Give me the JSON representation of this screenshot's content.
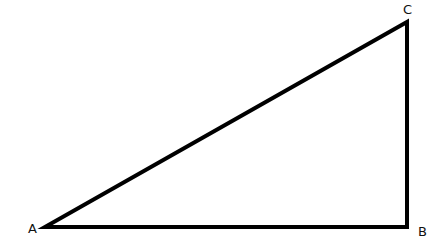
{
  "diagram": {
    "type": "right-triangle",
    "stroke_color": "#000000",
    "background": "#ffffff",
    "vertices": [
      {
        "label": "A",
        "x": 45,
        "y": 227,
        "label_x": 28,
        "label_y": 233
      },
      {
        "label": "B",
        "x": 407,
        "y": 227,
        "label_x": 418,
        "label_y": 236
      },
      {
        "label": "C",
        "x": 407,
        "y": 22,
        "label_x": 403,
        "label_y": 14
      }
    ],
    "right_angle_at": "B"
  }
}
